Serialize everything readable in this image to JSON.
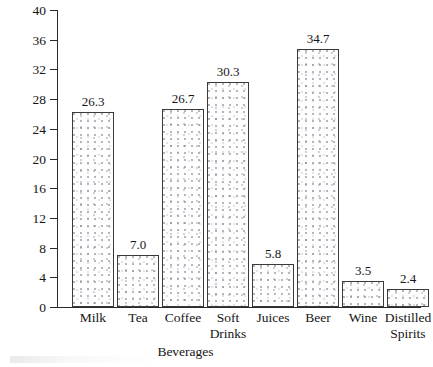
{
  "chart_data": {
    "type": "bar",
    "title": "",
    "xlabel": "Beverages",
    "ylabel": "Gallons Consumed",
    "categories": [
      "Milk",
      "Tea",
      "Coffee",
      "Soft Drinks",
      "Juices",
      "Beer",
      "Wine",
      "Distilled Spirits"
    ],
    "category_lines": [
      [
        "Milk"
      ],
      [
        "Tea"
      ],
      [
        "Coffee"
      ],
      [
        "Soft",
        "Drinks"
      ],
      [
        "Juices"
      ],
      [
        "Beer"
      ],
      [
        "Wine"
      ],
      [
        "Distilled",
        "Spirits"
      ]
    ],
    "values": [
      26.3,
      7.0,
      26.7,
      30.3,
      5.8,
      34.7,
      3.5,
      2.4
    ],
    "value_labels": [
      "26.3",
      "7.0",
      "26.7",
      "30.3",
      "5.8",
      "34.7",
      "3.5",
      "2.4"
    ],
    "ylim": [
      0,
      40
    ],
    "ytick_step": 4,
    "ytick_labels": [
      "0",
      "4",
      "8",
      "12",
      "16",
      "20",
      "24",
      "28",
      "32",
      "36",
      "40"
    ],
    "ytick_values": [
      0,
      4,
      8,
      12,
      16,
      20,
      24,
      28,
      32,
      36,
      40
    ],
    "grid": false,
    "legend": false,
    "legend_position": "none",
    "bar_fill": "stippled-dot-texture",
    "bar_edge_color": "#3a3a3a",
    "background_color": "#ffffff",
    "text_color": "#151515"
  }
}
